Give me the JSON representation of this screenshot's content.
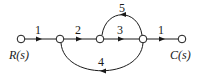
{
  "diagram": {
    "type": "signal-flow-graph",
    "nodes": [
      {
        "id": "n1",
        "label": "R(s)",
        "x": 21,
        "y": 39
      },
      {
        "id": "n2",
        "label": "",
        "x": 60,
        "y": 39
      },
      {
        "id": "n3",
        "label": "",
        "x": 100,
        "y": 39
      },
      {
        "id": "n4",
        "label": "",
        "x": 143,
        "y": 39
      },
      {
        "id": "n5",
        "label": "C(s)",
        "x": 182,
        "y": 39
      }
    ],
    "branches": [
      {
        "from": "n1",
        "to": "n2",
        "gain": "1"
      },
      {
        "from": "n2",
        "to": "n3",
        "gain": "2"
      },
      {
        "from": "n3",
        "to": "n4",
        "gain": "3"
      },
      {
        "from": "n4",
        "to": "n5",
        "gain": "1"
      },
      {
        "from": "n4",
        "to": "n3",
        "gain": "5",
        "shape": "arc-above"
      },
      {
        "from": "n4",
        "to": "n2",
        "gain": "4",
        "shape": "arc-below"
      }
    ],
    "input_label": "R(s)",
    "output_label": "C(s)"
  }
}
